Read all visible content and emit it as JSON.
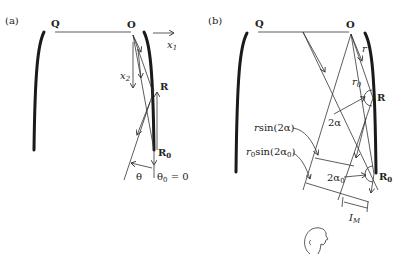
{
  "panel_a": {
    "label": "(a)",
    "points": {
      "Q": "Q",
      "O": "O",
      "R": "R",
      "R0": "R",
      "R0_sub": "0"
    },
    "axes": {
      "x1": "x",
      "x1_sub": "1",
      "x2": "x",
      "x2_sub": "2"
    },
    "angles": {
      "theta": "θ",
      "theta0": "θ",
      "theta0_sub": "0",
      "theta0_eq": " = 0"
    }
  },
  "panel_b": {
    "label": "(b)",
    "points": {
      "Q": "Q",
      "O": "O",
      "R": "R",
      "R0": "R",
      "R0_sub": "0"
    },
    "lengths": {
      "r": "r",
      "r0": "r",
      "r0_sub": "0"
    },
    "angles": {
      "two_alpha": "2α",
      "two_alpha0": "2α",
      "two_alpha0_sub": "0"
    },
    "annotations": {
      "rsin_r": "r",
      "rsin_rest": "sin(2α)",
      "r0sin_r": "r",
      "r0sin_sub": "0",
      "r0sin_rest": "sin(2α",
      "r0sin_sub2": "0",
      "r0sin_close": ")"
    },
    "width_label": "I",
    "width_sub": "M",
    "observer": "observer-head"
  }
}
